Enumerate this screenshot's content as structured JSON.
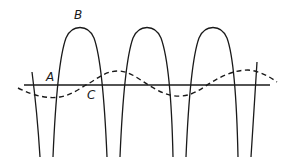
{
  "diagram": {
    "labels": {
      "a": "A",
      "b": "B",
      "c": "C"
    },
    "colors": {
      "stroke": "#1a1a1a",
      "background": "#ffffff"
    }
  }
}
